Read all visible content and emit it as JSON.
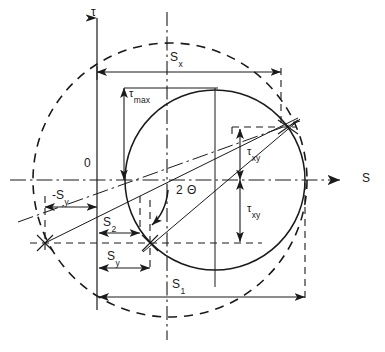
{
  "diagram": {
    "type": "engineering-stress-diagram",
    "axes": {
      "vertical_label": "τ",
      "horizontal_label": "S",
      "origin_label": "0"
    },
    "labels": {
      "sigma_x": {
        "base": "S",
        "sub": "x"
      },
      "sigma_y_negative": {
        "base": "-S",
        "sub": "y"
      },
      "sigma_y": {
        "base": "S",
        "sub": "y"
      },
      "sigma_1": {
        "base": "S",
        "sub": "1"
      },
      "sigma_2": {
        "base": "S",
        "sub": "2"
      },
      "tau_max": {
        "base": "τ",
        "sub": "max"
      },
      "tau_xy_upper": {
        "base": "τ",
        "sub": "xy"
      },
      "tau_xy_lower": {
        "base": "τ",
        "sub": "xy"
      },
      "angle": {
        "base": "2",
        "sub": "Θ"
      }
    },
    "colors": {
      "line": "#1a1a1a",
      "background": "#ffffff"
    },
    "geometry": {
      "solid_circle": {
        "cx": 215,
        "cy": 180,
        "r": 90
      },
      "dashed_circle": {
        "cx": 170,
        "cy": 180,
        "r": 137
      },
      "center_point": {
        "x": 215,
        "y": 180
      },
      "point_x": {
        "x": 288,
        "y": 127
      },
      "point_y": {
        "x": 150,
        "y": 243
      },
      "point_far_left": {
        "x": 45,
        "y": 243
      },
      "vertical_axis_x": 97,
      "horizontal_axis_y": 180,
      "dashdot_vertical_x": 167
    }
  }
}
